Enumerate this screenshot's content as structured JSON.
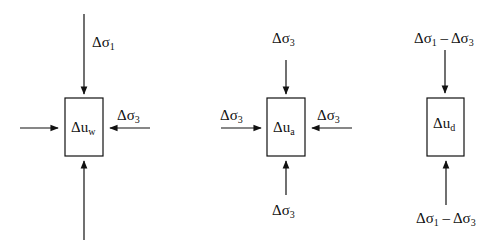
{
  "diagram": {
    "panels": [
      {
        "id": "water",
        "box_label": {
          "symbol": "Δu",
          "subscript": "w"
        },
        "top_label": {
          "symbol": "Δσ",
          "subscript": "1"
        },
        "right_label": {
          "symbol": "Δσ",
          "subscript": "3"
        }
      },
      {
        "id": "air",
        "box_label": {
          "symbol": "Δu",
          "subscript": "a"
        },
        "top_label": {
          "symbol": "Δσ",
          "subscript": "3"
        },
        "left_label": {
          "symbol": "Δσ",
          "subscript": "3"
        },
        "right_label": {
          "symbol": "Δσ",
          "subscript": "3"
        },
        "bottom_label": {
          "symbol": "Δσ",
          "subscript": "3"
        }
      },
      {
        "id": "deviator",
        "box_label": {
          "symbol": "Δu",
          "subscript": "d"
        },
        "top_label": {
          "a": "Δσ",
          "a_sub": "1",
          "op": " – ",
          "b": "Δσ",
          "b_sub": "3"
        },
        "bottom_label": {
          "a": "Δσ",
          "a_sub": "1",
          "op": " – ",
          "b": "Δσ",
          "b_sub": "3"
        }
      }
    ],
    "colors": {
      "stroke": "#111111",
      "background": "#ffffff"
    }
  }
}
